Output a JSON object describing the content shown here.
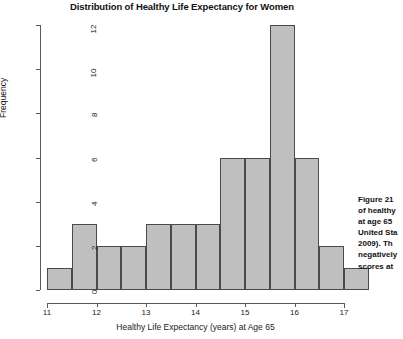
{
  "chart_data": {
    "type": "bar",
    "title": "Distribution of Healthy Life Expectancy for Women",
    "xlabel": "Healthy Life Expectancy (years) at Age 65",
    "ylabel": "Frequency",
    "bin_width": 0.5,
    "bin_starts": [
      11,
      11.5,
      12,
      12.5,
      13,
      13.5,
      14,
      14.5,
      15,
      15.5,
      16,
      16.5
    ],
    "categories": [
      "11-11.5",
      "11.5-12",
      "12-12.5",
      "12.5-13",
      "13-13.5",
      "13.5-14",
      "14-14.5",
      "14.5-15",
      "15-15.5",
      "15.5-16",
      "16-16.5",
      "16.5-17"
    ],
    "values": [
      1,
      3,
      2,
      2,
      3,
      3,
      3,
      6,
      6,
      12,
      6,
      2
    ],
    "last_value": 1,
    "xlim": [
      11,
      17
    ],
    "ylim": [
      0,
      12
    ],
    "xticks": [
      "11",
      "12",
      "13",
      "14",
      "15",
      "16",
      "17"
    ],
    "xtick_values": [
      11,
      12,
      13,
      14,
      15,
      16,
      17
    ],
    "yticks": [
      "0",
      "2",
      "4",
      "6",
      "8",
      "10",
      "12"
    ],
    "ytick_values": [
      0,
      2,
      4,
      6,
      8,
      10,
      12
    ],
    "grid": false,
    "legend": false,
    "bar_fill_color": "#bfbfbf",
    "bar_border_color": "#4a4a4a"
  },
  "caption": {
    "lines": [
      "Figure 21",
      "of healthy",
      "at age 65",
      "United Sta",
      "2009). Th",
      "negatively",
      "scores at"
    ]
  }
}
